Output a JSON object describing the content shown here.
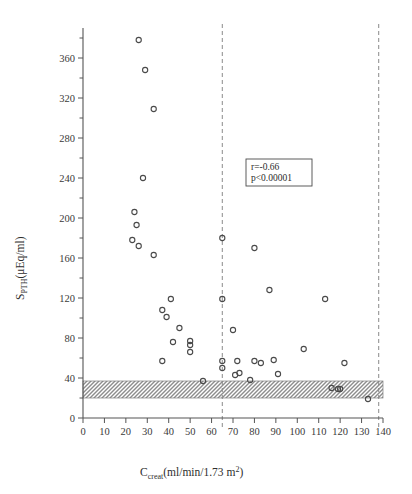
{
  "figure": {
    "background": "#ffffff",
    "axis_color": "#555555",
    "marker_color": "#4a4a4a",
    "band_color": "#9a9a9a",
    "dashed_color": "#8a8a8a"
  },
  "annotation": {
    "r_label": "r=-0.66",
    "p_label": "p<0.00001"
  },
  "axis_labels": {
    "y_main": "S",
    "y_sub": "PTH",
    "y_units": "(μEq/ml)",
    "x_main": "C",
    "x_sub": "creat",
    "x_units_pre": "(ml/min/1.73 m",
    "x_units_sup": "2",
    "x_units_post": ")"
  },
  "chart_data": {
    "type": "scatter",
    "title": "",
    "xlabel": "C_creat (ml/min/1.73 m2)",
    "ylabel": "S_PTH (μEq/ml)",
    "xlim": [
      0,
      140
    ],
    "ylim": [
      0,
      390
    ],
    "grid": false,
    "legend": null,
    "xticks": [
      0,
      10,
      20,
      30,
      40,
      50,
      60,
      70,
      80,
      90,
      100,
      110,
      120,
      130,
      140
    ],
    "xtick_labels": [
      "0",
      "10",
      "20",
      "30",
      "40",
      "50",
      "60",
      "70",
      "80",
      "90",
      "100",
      "110",
      "120",
      "130",
      "140"
    ],
    "yticks": [
      0,
      40,
      80,
      120,
      160,
      200,
      240,
      280,
      320,
      360
    ],
    "ytick_labels": [
      "0",
      "40",
      "80",
      "120",
      "160",
      "200",
      "240",
      "280",
      "320",
      "360"
    ],
    "yticks_minor": [
      20,
      60,
      100,
      140,
      180,
      220,
      260,
      300,
      340,
      380
    ],
    "annotations": [
      {
        "text": "r=-0.66",
        "x": 88,
        "y": 200
      },
      {
        "text": "p<0.00001",
        "x": 88,
        "y": 186
      }
    ],
    "reference_lines": [
      {
        "orientation": "vertical",
        "x": 65,
        "style": "dashed"
      },
      {
        "orientation": "vertical",
        "x": 138,
        "style": "dashed"
      }
    ],
    "reference_bands": [
      {
        "orientation": "horizontal",
        "y0": 20,
        "y1": 37,
        "style": "hatched",
        "label": "normal range"
      }
    ],
    "series": [
      {
        "name": "patients",
        "marker": "open-circle",
        "points": [
          [
            26,
            378
          ],
          [
            29,
            348
          ],
          [
            33,
            309
          ],
          [
            28,
            240
          ],
          [
            24,
            206
          ],
          [
            25,
            193
          ],
          [
            23,
            178
          ],
          [
            26,
            172
          ],
          [
            33,
            163
          ],
          [
            65,
            180
          ],
          [
            80,
            170
          ],
          [
            41,
            119
          ],
          [
            65,
            119
          ],
          [
            87,
            128
          ],
          [
            113,
            119
          ],
          [
            37,
            108
          ],
          [
            39,
            101
          ],
          [
            45,
            90
          ],
          [
            70,
            88
          ],
          [
            42,
            76
          ],
          [
            50,
            77
          ],
          [
            50,
            73
          ],
          [
            50,
            66
          ],
          [
            103,
            69
          ],
          [
            37,
            57
          ],
          [
            65,
            57
          ],
          [
            72,
            57
          ],
          [
            80,
            57
          ],
          [
            83,
            55
          ],
          [
            89,
            58
          ],
          [
            122,
            55
          ],
          [
            65,
            50
          ],
          [
            71,
            43
          ],
          [
            73,
            45
          ],
          [
            91,
            44
          ],
          [
            56,
            37
          ],
          [
            78,
            38
          ],
          [
            116,
            30
          ],
          [
            119,
            29
          ],
          [
            120,
            29
          ],
          [
            133,
            19
          ]
        ]
      }
    ]
  }
}
